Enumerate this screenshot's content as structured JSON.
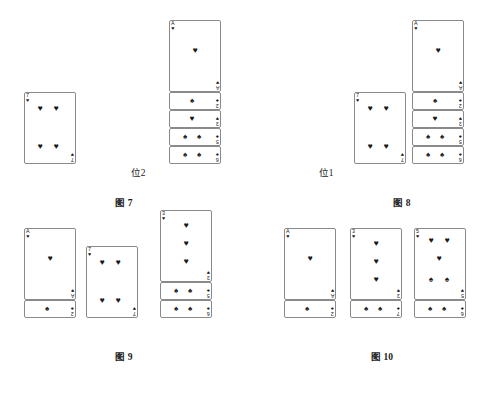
{
  "page": {
    "background": "#ffffff",
    "ink": "#1a1a1a",
    "card_border": "#8a8a8a"
  },
  "glyphs": {
    "heart": "♥",
    "spade": "♠"
  },
  "slot_labels": {
    "pos1": "位1",
    "pos2": "位2",
    "pos3": "位3"
  },
  "figures": [
    {
      "id": "fig7",
      "caption_prefix": "图",
      "caption_number": "7",
      "caption": "图 7",
      "slots": [
        {
          "name": "pos1",
          "label": "位1",
          "cards": [
            {
              "rank": "7",
              "suit": "heart",
              "pip_count": 4,
              "covered": false
            }
          ]
        },
        {
          "name": "pos2",
          "label": "位2",
          "cards": []
        },
        {
          "name": "pos3",
          "label": "位3",
          "cards": [
            {
              "rank": "A",
              "suit": "heart",
              "pip_count": 1,
              "covered": true
            },
            {
              "rank": "2",
              "suit": "spade",
              "pip_count": 1,
              "covered": true
            },
            {
              "rank": "3",
              "suit": "heart",
              "pip_count": 1,
              "covered": true
            },
            {
              "rank": "5",
              "suit": "spade",
              "pip_count": 2,
              "covered": true
            },
            {
              "rank": "6",
              "suit": "spade",
              "pip_count": 2,
              "covered": false
            }
          ]
        }
      ]
    },
    {
      "id": "fig8",
      "caption_prefix": "图",
      "caption_number": "8",
      "caption": "图 8",
      "slots": [
        {
          "name": "pos1",
          "label": "位1",
          "cards": []
        },
        {
          "name": "pos2",
          "label": "位2",
          "cards": [
            {
              "rank": "7",
              "suit": "heart",
              "pip_count": 4,
              "covered": false
            }
          ]
        },
        {
          "name": "pos3",
          "label": "位3",
          "cards": [
            {
              "rank": "A",
              "suit": "heart",
              "pip_count": 1,
              "covered": true
            },
            {
              "rank": "2",
              "suit": "spade",
              "pip_count": 1,
              "covered": true
            },
            {
              "rank": "3",
              "suit": "heart",
              "pip_count": 1,
              "covered": true
            },
            {
              "rank": "5",
              "suit": "spade",
              "pip_count": 2,
              "covered": true
            },
            {
              "rank": "6",
              "suit": "spade",
              "pip_count": 2,
              "covered": false
            }
          ]
        }
      ]
    },
    {
      "id": "fig9",
      "caption_prefix": "图",
      "caption_number": "9",
      "caption": "图 9",
      "slots": [
        {
          "name": "pos1",
          "label": "位1",
          "cards": [
            {
              "rank": "A",
              "suit": "heart",
              "pip_count": 1,
              "covered": true
            },
            {
              "rank": "2",
              "suit": "spade",
              "pip_count": 1,
              "covered": false
            }
          ]
        },
        {
          "name": "pos2",
          "label": "位2",
          "cards": [
            {
              "rank": "7",
              "suit": "heart",
              "pip_count": 4,
              "covered": false
            }
          ]
        },
        {
          "name": "pos3",
          "label": "位3",
          "cards": [
            {
              "rank": "3",
              "suit": "heart",
              "pip_count": 3,
              "covered": true
            },
            {
              "rank": "5",
              "suit": "spade",
              "pip_count": 2,
              "covered": true
            },
            {
              "rank": "6",
              "suit": "spade",
              "pip_count": 2,
              "covered": false
            }
          ]
        }
      ]
    },
    {
      "id": "fig10",
      "caption_prefix": "图",
      "caption_number": "10",
      "caption": "图 10",
      "slots": [
        {
          "name": "pos1",
          "label": "位1",
          "cards": [
            {
              "rank": "A",
              "suit": "heart",
              "pip_count": 1,
              "covered": true
            },
            {
              "rank": "2",
              "suit": "spade",
              "pip_count": 1,
              "covered": false
            }
          ]
        },
        {
          "name": "pos2",
          "label": "位2",
          "cards": [
            {
              "rank": "3",
              "suit": "heart",
              "pip_count": 3,
              "covered": true
            },
            {
              "rank": "7",
              "suit": "spade",
              "pip_count": 2,
              "covered": false
            }
          ]
        },
        {
          "name": "pos3",
          "label": "位3",
          "cards": [
            {
              "rank": "5",
              "suit": "heart",
              "pip_count": 3,
              "suit2": "spade",
              "pip_count2": 2,
              "covered": true
            },
            {
              "rank": "6",
              "suit": "spade",
              "pip_count": 2,
              "covered": false
            }
          ]
        }
      ]
    }
  ],
  "layout": {
    "card_width": 52,
    "card_full_height": 72,
    "covered_strip": 18,
    "figure_positions": {
      "fig7": {
        "x": 14,
        "y": 14,
        "slot_x": [
          10,
          98,
          155
        ],
        "baseline_y": 168
      },
      "fig8": {
        "x": 292,
        "y": 14,
        "slot_x": [
          8,
          62,
          120
        ],
        "baseline_y": 168
      },
      "fig9": {
        "x": 14,
        "y": 232,
        "slot_x": [
          10,
          72,
          146
        ],
        "baseline_y": 104
      },
      "fig10": {
        "x": 272,
        "y": 232,
        "slot_x": [
          12,
          78,
          142
        ],
        "baseline_y": 104
      }
    }
  }
}
